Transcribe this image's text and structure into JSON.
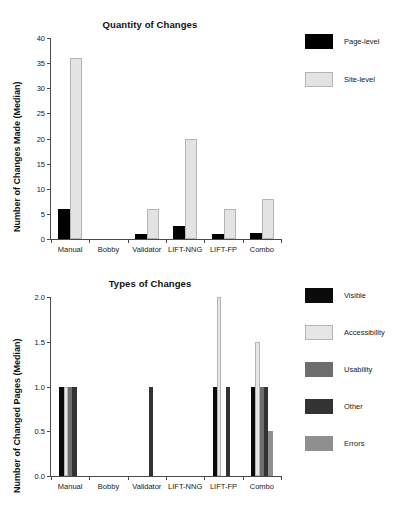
{
  "chart_data": [
    {
      "type": "bar",
      "title": "Quantity of Changes",
      "xlabel": "",
      "ylabel": "Number of Changes Made (Median)",
      "categories": [
        "Manual",
        "Bobby",
        "Validator",
        "LIFT-NNG",
        "LIFT-FP",
        "Combo"
      ],
      "ylim": [
        0,
        40
      ],
      "yticks": [
        "0",
        "5",
        "10",
        "15",
        "20",
        "25",
        "30",
        "35",
        "40"
      ],
      "ytick_values": [
        0,
        5,
        10,
        15,
        20,
        25,
        30,
        35,
        40
      ],
      "grid": false,
      "legend_position": "right",
      "series": [
        {
          "name": "Page-level",
          "color": "#000000",
          "values": [
            6,
            0,
            1,
            2.5,
            1,
            1.2
          ]
        },
        {
          "name": "Site-level",
          "color": "#e3e3e3",
          "values": [
            36,
            0,
            6,
            20,
            6,
            8
          ]
        }
      ]
    },
    {
      "type": "bar",
      "title": "Types of Changes",
      "xlabel": "",
      "ylabel": "Number of Changed Pages (Median)",
      "categories": [
        "Manual",
        "Bobby",
        "Validator",
        "LIFT-NNG",
        "LIFT-FP",
        "Combo"
      ],
      "ylim": [
        0,
        2.0
      ],
      "yticks": [
        "0.0",
        "0.5",
        "1.0",
        "1.5",
        "2.0"
      ],
      "ytick_values": [
        0,
        0.5,
        1.0,
        1.5,
        2.0
      ],
      "grid": false,
      "legend_position": "right",
      "series": [
        {
          "name": "Visible",
          "color": "#0a0a0a",
          "values": [
            1.0,
            0,
            0,
            0,
            1.0,
            1.0
          ]
        },
        {
          "name": "Accessibility",
          "color": "#e6e6e6",
          "values": [
            1.0,
            0,
            0,
            0,
            2.0,
            1.5
          ]
        },
        {
          "name": "Usability",
          "color": "#6e6e6e",
          "values": [
            1.0,
            0,
            0,
            0,
            0,
            1.0
          ]
        },
        {
          "name": "Other",
          "color": "#333333",
          "values": [
            1.0,
            0,
            1.0,
            0,
            1.0,
            1.0
          ]
        },
        {
          "name": "Errors",
          "color": "#8f8f8f",
          "values": [
            0,
            0,
            0,
            0,
            0,
            0.5
          ]
        }
      ]
    }
  ]
}
